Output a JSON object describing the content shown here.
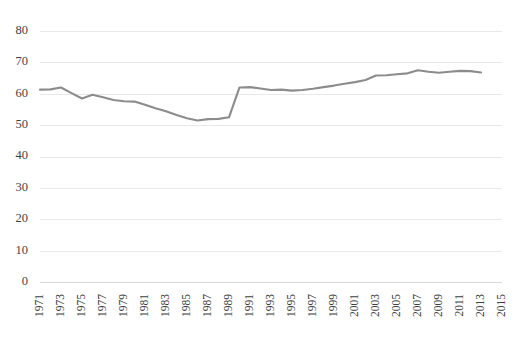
{
  "chart_data": {
    "type": "line",
    "title": "",
    "subtitle": "",
    "xlabel": "",
    "ylabel": "",
    "grid": true,
    "legend": false,
    "legend_position": "none",
    "line_color": "#8c8c8c",
    "grid_color": "#e8e8e8",
    "text_color": "#3f3f3f",
    "background_color": "#ffffff",
    "xlim": [
      1971,
      2015
    ],
    "ylim": [
      0,
      80
    ],
    "ytick_labels": [
      "80",
      "70",
      "60",
      "50",
      "40",
      "30",
      "20",
      "10",
      "0"
    ],
    "ytick_values": [
      80,
      70,
      60,
      50,
      40,
      30,
      20,
      10,
      0
    ],
    "xtick_labels": [
      "1971",
      "1973",
      "1975",
      "1977",
      "1979",
      "1981",
      "1983",
      "1985",
      "1987",
      "1989",
      "1991",
      "1993",
      "1995",
      "1997",
      "1999",
      "2001",
      "2003",
      "2005",
      "2007",
      "2009",
      "2011",
      "2013",
      "2015"
    ],
    "xtick_values": [
      1971,
      1973,
      1975,
      1977,
      1979,
      1981,
      1983,
      1985,
      1987,
      1989,
      1991,
      1993,
      1995,
      1997,
      1999,
      2001,
      2003,
      2005,
      2007,
      2009,
      2011,
      2013,
      2015
    ],
    "x": [
      1971,
      1972,
      1973,
      1974,
      1975,
      1976,
      1977,
      1978,
      1979,
      1980,
      1981,
      1982,
      1983,
      1984,
      1985,
      1986,
      1987,
      1988,
      1989,
      1990,
      1991,
      1992,
      1993,
      1994,
      1995,
      1996,
      1997,
      1998,
      1999,
      2000,
      2001,
      2002,
      2003,
      2004,
      2005,
      2006,
      2007,
      2008,
      2009,
      2010,
      2011,
      2012,
      2013
    ],
    "values": [
      61.3,
      61.4,
      62.0,
      60.2,
      58.5,
      59.7,
      58.9,
      58.0,
      57.6,
      57.5,
      56.5,
      55.4,
      54.4,
      53.2,
      52.2,
      51.5,
      51.9,
      52.0,
      52.5,
      62.0,
      62.1,
      61.7,
      61.2,
      61.3,
      61.0,
      61.2,
      61.6,
      62.1,
      62.6,
      63.2,
      63.7,
      64.4,
      65.8,
      65.9,
      66.2,
      66.5,
      67.5,
      67.0,
      66.7,
      67.0,
      67.3,
      67.2,
      66.8
    ]
  }
}
